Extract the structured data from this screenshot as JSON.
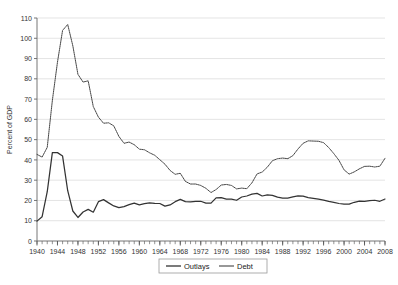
{
  "chart_data": {
    "type": "line",
    "title": "",
    "xlabel": "",
    "ylabel": "Percent of GDP",
    "xlim": [
      1940,
      2008
    ],
    "ylim": [
      0,
      110
    ],
    "ytick_step": 10,
    "yticks": [
      0,
      10,
      20,
      30,
      40,
      50,
      60,
      70,
      80,
      90,
      100,
      110
    ],
    "xticks_labeled": [
      1940,
      1944,
      1948,
      1952,
      1956,
      1960,
      1964,
      1968,
      1972,
      1976,
      1980,
      1984,
      1988,
      1992,
      1996,
      2000,
      2004,
      2008
    ],
    "xtick_minor_step": 1,
    "grid": "horizontal",
    "legend_position": "bottom-center",
    "x": [
      1940,
      1941,
      1942,
      1943,
      1944,
      1945,
      1946,
      1947,
      1948,
      1949,
      1950,
      1951,
      1952,
      1953,
      1954,
      1955,
      1956,
      1957,
      1958,
      1959,
      1960,
      1961,
      1962,
      1963,
      1964,
      1965,
      1966,
      1967,
      1968,
      1969,
      1970,
      1971,
      1972,
      1973,
      1974,
      1975,
      1976,
      1977,
      1978,
      1979,
      1980,
      1981,
      1982,
      1983,
      1984,
      1985,
      1986,
      1987,
      1988,
      1989,
      1990,
      1991,
      1992,
      1993,
      1994,
      1995,
      1996,
      1997,
      1998,
      1999,
      2000,
      2001,
      2002,
      2003,
      2004,
      2005,
      2006,
      2007,
      2008
    ],
    "series": [
      {
        "name": "Outlays",
        "style": "solid",
        "color": "#333333",
        "values": [
          9.8,
          12.0,
          24.3,
          43.6,
          43.6,
          41.9,
          24.8,
          14.8,
          11.6,
          14.3,
          15.6,
          14.2,
          19.4,
          20.4,
          18.8,
          17.3,
          16.5,
          17.0,
          17.9,
          18.7,
          17.8,
          18.4,
          18.8,
          18.6,
          18.5,
          17.2,
          17.8,
          19.4,
          20.5,
          19.4,
          19.3,
          19.5,
          19.6,
          18.7,
          18.7,
          21.3,
          21.4,
          20.7,
          20.7,
          20.1,
          21.7,
          22.2,
          23.1,
          23.5,
          22.2,
          22.8,
          22.5,
          21.6,
          21.2,
          21.2,
          21.8,
          22.3,
          22.1,
          21.4,
          21.0,
          20.6,
          20.2,
          19.5,
          19.1,
          18.5,
          18.2,
          18.2,
          19.1,
          19.7,
          19.6,
          19.9,
          20.1,
          19.6,
          20.7
        ]
      },
      {
        "name": "Debt",
        "style": "dotted",
        "color": "#444444",
        "values": [
          42.7,
          41.4,
          46.2,
          69.3,
          88.2,
          103.9,
          106.8,
          96.3,
          82.2,
          78.4,
          79.0,
          66.3,
          61.1,
          58.1,
          58.3,
          56.8,
          51.6,
          48.2,
          48.8,
          47.5,
          45.3,
          45.0,
          43.5,
          42.3,
          40.1,
          37.9,
          34.8,
          32.9,
          33.4,
          29.4,
          28.1,
          28.1,
          27.4,
          26.0,
          23.9,
          25.4,
          27.6,
          27.9,
          27.4,
          25.7,
          26.1,
          25.8,
          28.7,
          33.1,
          34.0,
          36.4,
          39.6,
          40.6,
          40.9,
          40.6,
          42.1,
          45.4,
          48.2,
          49.4,
          49.3,
          49.2,
          48.5,
          46.1,
          43.1,
          39.8,
          35.1,
          33.0,
          34.1,
          35.6,
          36.8,
          36.9,
          36.5,
          36.9,
          40.8
        ]
      }
    ]
  },
  "legend": {
    "items": [
      {
        "label": "Outlays"
      },
      {
        "label": "Debt"
      }
    ]
  },
  "axis": {
    "y_title": "Percent of GDP"
  }
}
